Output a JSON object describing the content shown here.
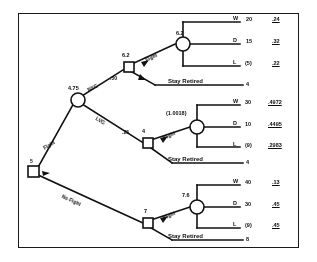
{
  "figure": {
    "type": "decision-tree",
    "root": {
      "value": "5"
    },
    "chance_root": {
      "value": "4.75"
    },
    "branches": {
      "fight_label": "Fight",
      "no_fight_label": "No Fight",
      "venue_top_label": "NYC",
      "venue_mid_label": "LVG",
      "prob_top": ".50",
      "prob_mid": ".25"
    },
    "subtrees": [
      {
        "decision_value": "6.2",
        "fight_label": "Fight",
        "stay_label": "Stay Retired",
        "stay_payoff": "4",
        "chance_value": "6.2",
        "outcomes": [
          {
            "code": "W",
            "payoff": "20",
            "prob": ".24"
          },
          {
            "code": "D",
            "payoff": "15",
            "prob": ".32"
          },
          {
            "code": "L",
            "payoff": "(5)",
            "prob": ".22"
          }
        ]
      },
      {
        "decision_value": "4",
        "fight_label": "Fight",
        "stay_label": "Stay Retired",
        "stay_payoff": "4",
        "chance_value": "(1.0018)",
        "outcomes": [
          {
            "code": "W",
            "payoff": "30",
            "prob": ".4972"
          },
          {
            "code": "D",
            "payoff": "10",
            "prob": ".4495"
          },
          {
            "code": "L",
            "payoff": "(9)",
            "prob": ".2983"
          }
        ]
      },
      {
        "decision_value": "7",
        "fight_label": "Fight",
        "stay_label": "Stay Retired",
        "stay_payoff": "8",
        "chance_value": "7.6",
        "outcomes": [
          {
            "code": "W",
            "payoff": "40",
            "prob": ".13"
          },
          {
            "code": "D",
            "payoff": "30",
            "prob": ".45"
          },
          {
            "code": "L",
            "payoff": "(9)",
            "prob": ".45"
          }
        ]
      }
    ],
    "colors": {
      "ink": "#111111",
      "paper": "#ffffff"
    }
  }
}
